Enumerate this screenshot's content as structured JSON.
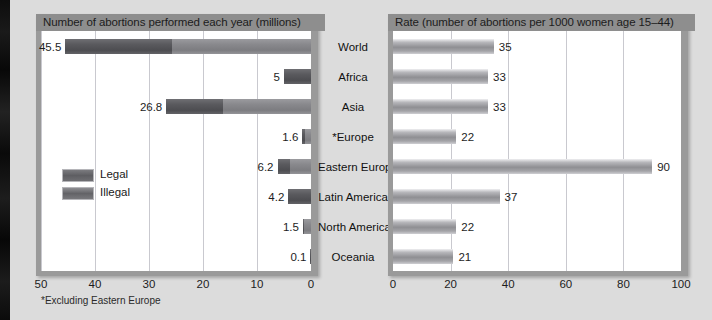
{
  "left_chart": {
    "title": "Number of abortions performed each year (millions)",
    "footnote": "*Excluding Eastern Europe",
    "axis_ticks": [
      "50",
      "40",
      "30",
      "20",
      "10",
      "0"
    ],
    "legend": [
      {
        "key": "legal",
        "label": "Legal"
      },
      {
        "key": "illegal",
        "label": "Illegal"
      }
    ]
  },
  "right_chart": {
    "title": "Rate (number of abortions per 1000 women age 15–44)",
    "axis_ticks": [
      "0",
      "20",
      "40",
      "60",
      "80",
      "100"
    ]
  },
  "categories": [
    "World",
    "Africa",
    "Asia",
    "*Europe",
    "Eastern Europe",
    "Latin America",
    "North America",
    "Oceania"
  ],
  "left_values": [
    "45.5",
    "5",
    "26.8",
    "1.6",
    "6.2",
    "4.2",
    "1.5",
    "0.1"
  ],
  "right_values": [
    "35",
    "33",
    "33",
    "22",
    "90",
    "37",
    "22",
    "21"
  ],
  "chart_data": [
    {
      "type": "bar",
      "id": "totals",
      "orientation": "horizontal",
      "direction": "right-to-left",
      "title": "Number of abortions performed each year (millions)",
      "xlabel": "",
      "ylabel": "",
      "xlim": [
        0,
        50
      ],
      "xticks": [
        50,
        40,
        30,
        20,
        10,
        0
      ],
      "grid": true,
      "legend": [
        "Legal",
        "Illegal"
      ],
      "legend_position": "inside-left",
      "stacked": true,
      "categories": [
        "World",
        "Africa",
        "Asia",
        "*Europe",
        "Eastern Europe",
        "Latin America",
        "North America",
        "Oceania"
      ],
      "values": [
        45.5,
        5,
        26.8,
        1.6,
        6.2,
        4.2,
        1.5,
        0.1
      ],
      "series": [
        {
          "name": "Illegal",
          "values": [
            19.7,
            5,
            10.5,
            0.5,
            2.4,
            4.2,
            0.2,
            0.1
          ]
        },
        {
          "name": "Legal",
          "values": [
            25.8,
            0,
            16.3,
            1.1,
            3.8,
            0,
            1.3,
            0
          ]
        }
      ],
      "annotations": [
        "*Excluding Eastern Europe"
      ]
    },
    {
      "type": "bar",
      "id": "rates",
      "orientation": "horizontal",
      "direction": "left-to-right",
      "title": "Rate (number of abortions per 1000 women age 15–44)",
      "xlabel": "",
      "ylabel": "",
      "xlim": [
        0,
        100
      ],
      "xticks": [
        0,
        20,
        40,
        60,
        80,
        100
      ],
      "grid": true,
      "categories": [
        "World",
        "Africa",
        "Asia",
        "*Europe",
        "Eastern Europe",
        "Latin America",
        "North America",
        "Oceania"
      ],
      "values": [
        35,
        33,
        33,
        22,
        90,
        37,
        22,
        21
      ]
    }
  ],
  "colors": {
    "page_background": "#dcdcdc",
    "panel_frame": "#9a9a9a",
    "title_bar": "#8e8e8e",
    "plot_background": "#ffffff",
    "gridline": "#c9c9cf",
    "legal_bar": "#8a8a8e",
    "illegal_bar": "#57575b",
    "rate_bar": "#9b9b9f",
    "text": "#1a1a1a"
  }
}
